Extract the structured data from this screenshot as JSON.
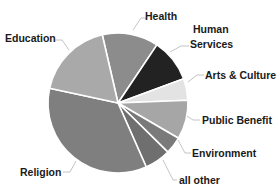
{
  "chart_data": {
    "type": "pie",
    "title": "",
    "start_angle_deg": -13,
    "direction": "clockwise",
    "legend": "none (direct labels with leader lines)",
    "categories": [
      "Health",
      "Human Services",
      "Arts & Culture",
      "Public Benefit",
      "Environment",
      "all other",
      "Religion",
      "Education"
    ],
    "values": [
      13,
      10,
      5,
      9,
      4,
      6,
      35,
      18
    ],
    "unit": "percent (estimated from slice angles)",
    "colors": [
      "#8c8c8c",
      "#222222",
      "#e3e3e3",
      "#a6a6a6",
      "#7a7a7a",
      "#6f6f6f",
      "#7f7f7f",
      "#a9a9a9"
    ]
  },
  "labels": {
    "health": "Health",
    "human_services_line1": "Human",
    "human_services_line2": "Services",
    "arts_culture": "Arts & Culture",
    "public_benefit": "Public Benefit",
    "environment": "Environment",
    "all_other": "all other",
    "religion": "Religion",
    "education": "Education"
  }
}
